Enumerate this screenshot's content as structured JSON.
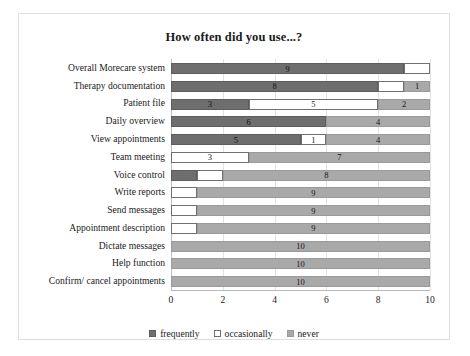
{
  "chart": {
    "title": "How often did you use...?"
  },
  "chart_data": {
    "type": "bar",
    "orientation": "horizontal",
    "stacked": true,
    "title": "How often did you use...?",
    "xlabel": "",
    "ylabel": "",
    "xlim": [
      0,
      10
    ],
    "xticks": [
      0,
      2,
      4,
      6,
      8,
      10
    ],
    "grid": true,
    "legend_position": "bottom",
    "legend": [
      "frequently",
      "occasionally",
      "never"
    ],
    "colors": {
      "frequently": "#6e6e6e",
      "occasionally": "#ffffff",
      "never": "#a9a9a9",
      "background": "#ffffff",
      "gridline": "#e2e2e2",
      "text": "#1b1b1b"
    },
    "categories": [
      "Overall Morecare system",
      "Therapy documentation",
      "Patient file",
      "Daily overview",
      "View appointments",
      "Team meeting",
      "Voice control",
      "Write reports",
      "Send messages",
      "Appointment description",
      "Dictate messages",
      "Help function",
      "Confirm/ cancel appointments"
    ],
    "series": [
      {
        "name": "frequently",
        "values": [
          9,
          8,
          3,
          6,
          5,
          0,
          1,
          0,
          0,
          0,
          0,
          0,
          0
        ]
      },
      {
        "name": "occasionally",
        "values": [
          1,
          1,
          5,
          0,
          1,
          3,
          1,
          1,
          1,
          1,
          0,
          0,
          0
        ]
      },
      {
        "name": "never",
        "values": [
          0,
          1,
          2,
          4,
          4,
          7,
          8,
          9,
          9,
          9,
          10,
          10,
          10
        ]
      }
    ],
    "data_labels": [
      {
        "category": "Overall Morecare system",
        "frequently": "9",
        "occasionally": "",
        "never": ""
      },
      {
        "category": "Therapy documentation",
        "frequently": "8",
        "occasionally": "",
        "never": "1"
      },
      {
        "category": "Patient file",
        "frequently": "3",
        "occasionally": "5",
        "never": "2"
      },
      {
        "category": "Daily overview",
        "frequently": "6",
        "occasionally": "",
        "never": "4"
      },
      {
        "category": "View appointments",
        "frequently": "5",
        "occasionally": "1",
        "never": "4"
      },
      {
        "category": "Team meeting",
        "frequently": "",
        "occasionally": "3",
        "never": "7"
      },
      {
        "category": "Voice control",
        "frequently": "",
        "occasionally": "",
        "never": "8"
      },
      {
        "category": "Write reports",
        "frequently": "",
        "occasionally": "",
        "never": "9"
      },
      {
        "category": "Send messages",
        "frequently": "",
        "occasionally": "",
        "never": "9"
      },
      {
        "category": "Appointment description",
        "frequently": "",
        "occasionally": "",
        "never": "9"
      },
      {
        "category": "Dictate messages",
        "frequently": "",
        "occasionally": "",
        "never": "10"
      },
      {
        "category": "Help function",
        "frequently": "",
        "occasionally": "",
        "never": "10"
      },
      {
        "category": "Confirm/ cancel appointments",
        "frequently": "",
        "occasionally": "",
        "never": "10"
      }
    ]
  }
}
